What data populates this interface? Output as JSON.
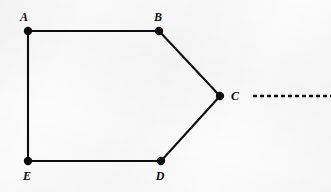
{
  "figure": {
    "background_color": "#fbfbfb",
    "stroke_color": "#0d0d0d",
    "width": 331,
    "height": 192
  },
  "vertices": [
    {
      "id": "A",
      "label": "A",
      "x": 28,
      "y": 31,
      "label_x": 24,
      "label_y": 21,
      "label_anchor": "middle"
    },
    {
      "id": "B",
      "label": "B",
      "x": 159,
      "y": 31,
      "label_x": 158,
      "label_y": 21,
      "label_anchor": "middle"
    },
    {
      "id": "C",
      "label": "C",
      "x": 220,
      "y": 96,
      "label_x": 231,
      "label_y": 100,
      "label_anchor": "start"
    },
    {
      "id": "D",
      "label": "D",
      "x": 161,
      "y": 161,
      "label_x": 160,
      "label_y": 180,
      "label_anchor": "middle"
    },
    {
      "id": "E",
      "label": "E",
      "x": 28,
      "y": 161,
      "label_x": 27,
      "label_y": 180,
      "label_anchor": "middle"
    }
  ],
  "edges": [
    {
      "id": "AB",
      "from": "A",
      "to": "B",
      "style": "solid",
      "x1": 28,
      "y1": 31,
      "x2": 159,
      "y2": 31
    },
    {
      "id": "BC",
      "from": "B",
      "to": "C",
      "style": "solid",
      "x1": 159,
      "y1": 31,
      "x2": 220,
      "y2": 96
    },
    {
      "id": "CD",
      "from": "C",
      "to": "D",
      "style": "solid",
      "x1": 220,
      "y1": 96,
      "x2": 161,
      "y2": 161
    },
    {
      "id": "DE",
      "from": "D",
      "to": "E",
      "style": "solid",
      "x1": 161,
      "y1": 161,
      "x2": 28,
      "y2": 161
    },
    {
      "id": "EA",
      "from": "E",
      "to": "A",
      "style": "solid",
      "x1": 28,
      "y1": 161,
      "x2": 28,
      "y2": 31
    }
  ],
  "rays": [
    {
      "id": "C-ray-right",
      "from": "C",
      "style": "dashed",
      "dash_pattern": "4 3",
      "x1": 253,
      "y1": 96,
      "x2": 331,
      "y2": 96
    }
  ],
  "dot_radius": 4.2
}
